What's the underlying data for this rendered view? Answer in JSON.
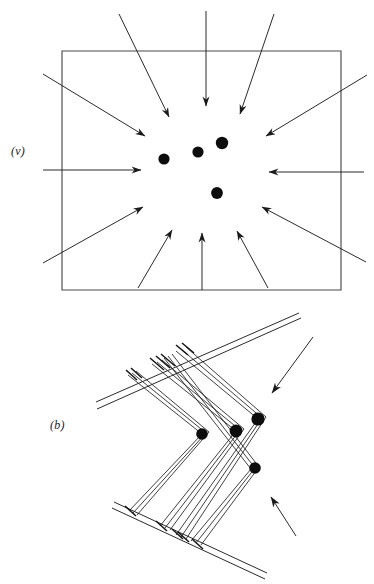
{
  "figure": {
    "type": "scientific-diagram",
    "background_color": "#ffffff",
    "ink_color": "#1a1a1a",
    "width": 374,
    "height": 584
  },
  "panels": [
    {
      "id": "panel-v",
      "label": "(v)",
      "label_position": {
        "x": 11,
        "y": 144
      },
      "description": "rectangular boundary with arrows converging inward toward a cluster of four filled dots",
      "boundary": {
        "x": 62,
        "y": 51,
        "width": 279,
        "height": 239,
        "stroke": "#3a3a3a",
        "stroke_width": 1
      },
      "dots": [
        {
          "cx": 164,
          "cy": 159,
          "r": 5.6
        },
        {
          "cx": 198,
          "cy": 152,
          "r": 5.6
        },
        {
          "cx": 222,
          "cy": 143,
          "r": 6.2
        },
        {
          "cx": 217,
          "cy": 193,
          "r": 5.9
        }
      ],
      "arrows": [
        {
          "name": "arrow-top-left-in",
          "x1": 119,
          "y1": 14,
          "x2": 169,
          "y2": 117
        },
        {
          "name": "arrow-top-center-down",
          "x1": 206,
          "y1": 11,
          "x2": 206,
          "y2": 106
        },
        {
          "name": "arrow-top-right-in",
          "x1": 274,
          "y1": 14,
          "x2": 240,
          "y2": 114
        },
        {
          "name": "arrow-upper-left-diag",
          "x1": 43,
          "y1": 74,
          "x2": 145,
          "y2": 136
        },
        {
          "name": "arrow-upper-right-diag",
          "x1": 367,
          "y1": 75,
          "x2": 266,
          "y2": 136
        },
        {
          "name": "arrow-left-horizontal",
          "x1": 43,
          "y1": 170,
          "x2": 141,
          "y2": 170
        },
        {
          "name": "arrow-right-horizontal",
          "x1": 364,
          "y1": 172,
          "x2": 269,
          "y2": 172
        },
        {
          "name": "arrow-lower-left-diag",
          "x1": 43,
          "y1": 263,
          "x2": 143,
          "y2": 207
        },
        {
          "name": "arrow-lower-right-diag",
          "x1": 366,
          "y1": 262,
          "x2": 262,
          "y2": 207
        },
        {
          "name": "arrow-bottom-left-up",
          "x1": 138,
          "y1": 288,
          "x2": 172,
          "y2": 230
        },
        {
          "name": "arrow-bottom-center-up",
          "x1": 202,
          "y1": 290,
          "x2": 202,
          "y2": 233
        },
        {
          "name": "arrow-bottom-right-up",
          "x1": 268,
          "y1": 288,
          "x2": 237,
          "y2": 231
        }
      ]
    },
    {
      "id": "panel-b",
      "label": "(b)",
      "label_position": {
        "x": 50,
        "y": 418
      },
      "description": "zigzag dislocation array: two parallel-line grain-boundary bands joined by bundles of bent lines terminating at four filled dots, with two external arrows",
      "bands": [
        {
          "name": "upper-band",
          "lines": [
            {
              "x1": 96,
              "y1": 402,
              "x2": 299,
              "y2": 313
            },
            {
              "x1": 97,
              "y1": 409,
              "x2": 301,
              "y2": 318
            }
          ]
        },
        {
          "name": "lower-band",
          "lines": [
            {
              "x1": 114,
              "y1": 502,
              "x2": 267,
              "y2": 573
            },
            {
              "x1": 112,
              "y1": 508,
              "x2": 265,
              "y2": 579
            }
          ]
        }
      ],
      "dots": [
        {
          "cx": 202,
          "cy": 434,
          "r": 5.8
        },
        {
          "cx": 236,
          "cy": 431,
          "r": 6.4
        },
        {
          "cx": 258,
          "cy": 419,
          "r": 6.6
        },
        {
          "cx": 255,
          "cy": 468,
          "r": 5.8
        }
      ],
      "arrows": [
        {
          "name": "arrow-upper-incoming",
          "x1": 313,
          "y1": 337,
          "x2": 272,
          "y2": 393
        },
        {
          "name": "arrow-lower-incoming",
          "x1": 296,
          "y1": 536,
          "x2": 271,
          "y2": 497
        }
      ]
    }
  ]
}
